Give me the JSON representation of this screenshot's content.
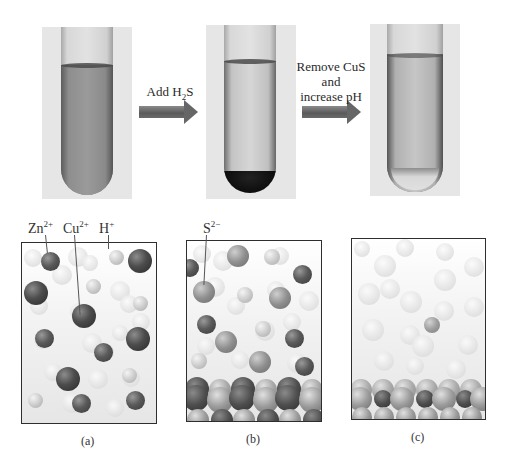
{
  "figure": {
    "tubes": [
      {
        "id": "tube-a",
        "description": "solution with Zn2+, Cu2+, H+",
        "liquid_color": "#8d8d8d"
      },
      {
        "id": "tube-b",
        "description": "CuS precipitate at bottom",
        "liquid_color": "#cfcfcf",
        "precipitate_color": "#111111"
      },
      {
        "id": "tube-c",
        "description": "after CuS removal and pH increase",
        "liquid_color": "#bdbdbd"
      }
    ],
    "steps": [
      {
        "label_main": "Add H",
        "label_sub": "2",
        "label_tail": "S"
      },
      {
        "line1": "Remove CuS",
        "line2": "and",
        "line3": "increase pH"
      }
    ],
    "ion_labels": {
      "zn": {
        "base": "Zn",
        "charge": "2+"
      },
      "cu": {
        "base": "Cu",
        "charge": "2+"
      },
      "h": {
        "base": "H",
        "charge": "+"
      },
      "s": {
        "base": "S",
        "charge": "2−"
      }
    },
    "captions": [
      "(a)",
      "(b)",
      "(c)"
    ]
  },
  "colors": {
    "background": "#ffffff",
    "photo_background": "#e6e6e6",
    "panel_border": "#2e2e2e",
    "text": "#333333"
  }
}
